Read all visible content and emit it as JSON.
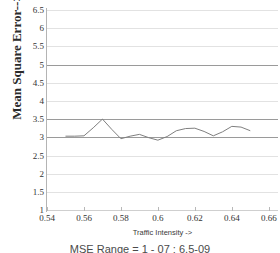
{
  "chart_data": {
    "type": "line",
    "title": "",
    "xlabel": "Traffic Intensity ->",
    "ylabel": "Mean Square Error-->",
    "xlim": [
      0.54,
      0.665
    ],
    "ylim": [
      1,
      6.5
    ],
    "grid": true,
    "legend": null,
    "xticks": [
      "0.54",
      "0.56",
      "0.58",
      "0.6",
      "0.62",
      "0.64",
      "0.66"
    ],
    "xtick_values": [
      0.54,
      0.56,
      0.58,
      0.6,
      0.62,
      0.64,
      0.66
    ],
    "yticks": [
      "6.5",
      "6",
      "5.5",
      "5",
      "4.5",
      "4",
      "3.5",
      "3",
      "2.5",
      "2",
      "1.5",
      "1"
    ],
    "ytick_values": [
      6.5,
      6,
      5.5,
      5,
      4.5,
      4,
      3.5,
      3,
      2.5,
      2,
      1.5,
      1
    ],
    "emphasized_gridlines": [
      5,
      3.5,
      3
    ],
    "series": [
      {
        "name": "MSE",
        "color": "#7f7f7f",
        "x": [
          0.55,
          0.555,
          0.56,
          0.565,
          0.57,
          0.575,
          0.58,
          0.585,
          0.59,
          0.595,
          0.6,
          0.605,
          0.61,
          0.615,
          0.62,
          0.625,
          0.63,
          0.635,
          0.64,
          0.645,
          0.65
        ],
        "values": [
          3.03,
          3.03,
          3.04,
          3.26,
          3.5,
          3.22,
          2.96,
          3.03,
          3.08,
          2.99,
          2.92,
          3.02,
          3.18,
          3.24,
          3.25,
          3.16,
          3.04,
          3.15,
          3.3,
          3.28,
          3.18
        ]
      }
    ]
  },
  "caption": {
    "text": "MSE Range = 1 - 07 : 6.5-09"
  }
}
